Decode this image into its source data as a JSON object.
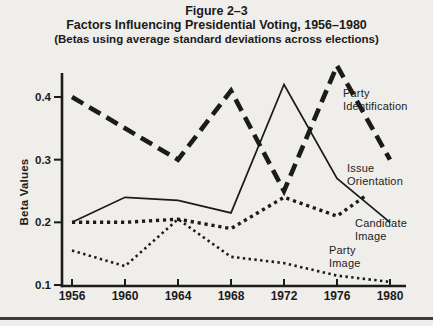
{
  "page": {
    "background": "#f0eeea",
    "ink": "#1b1b1b",
    "rule_color": "#3c3c3c"
  },
  "header": {
    "figure_label": "Figure 2–3",
    "title": "Factors Influencing Presidential Voting, 1956–1980",
    "subtitle": "(Betas using average standard deviations across elections)"
  },
  "chart_data": {
    "type": "line",
    "title": "Factors Influencing Presidential Voting, 1956–1980",
    "subtitle": "(Betas using average standard deviations across elections)",
    "xlabel": "",
    "ylabel": "Beta Values",
    "x": [
      1956,
      1960,
      1964,
      1968,
      1972,
      1976,
      1980
    ],
    "x_tick_labels": [
      "1956",
      "1960",
      "1964",
      "1968",
      "1972",
      "1976",
      "1980"
    ],
    "y_ticks": [
      0.1,
      0.2,
      0.3,
      0.4
    ],
    "y_tick_labels": [
      "0.1",
      "0.2",
      "0.3",
      "0.4"
    ],
    "ylim": [
      0.1,
      0.44
    ],
    "grid": false,
    "legend_position": "inline-right-labels",
    "series": [
      {
        "name": "Party Identification",
        "slug": "party-identification",
        "style": "heavy-dash",
        "values": [
          0.4,
          0.35,
          0.3,
          0.41,
          0.25,
          0.45,
          0.3
        ],
        "label": "Party\nIdentification",
        "label_pos": {
          "x": 343,
          "y": 87
        }
      },
      {
        "name": "Issue Orientation",
        "slug": "issue-orientation",
        "style": "solid",
        "values": [
          0.2,
          0.24,
          0.235,
          0.215,
          0.42,
          0.27,
          0.2
        ],
        "label": "Issue\nOrientation",
        "label_pos": {
          "x": 347,
          "y": 162
        }
      },
      {
        "name": "Candidate Image",
        "slug": "candidate-image",
        "style": "dotted-heavy",
        "values": [
          0.2,
          0.2,
          0.205,
          0.19,
          0.24,
          0.21,
          0.27
        ],
        "x_end_year": 1978.2,
        "label": "Candidate\nImage",
        "label_pos": {
          "x": 355,
          "y": 217
        }
      },
      {
        "name": "Party Image",
        "slug": "party-image",
        "style": "dotted-fine",
        "values": [
          0.155,
          0.13,
          0.205,
          0.145,
          0.135,
          0.115,
          0.105
        ],
        "label": "Party\nImage",
        "label_pos": {
          "x": 329,
          "y": 244
        }
      }
    ]
  }
}
